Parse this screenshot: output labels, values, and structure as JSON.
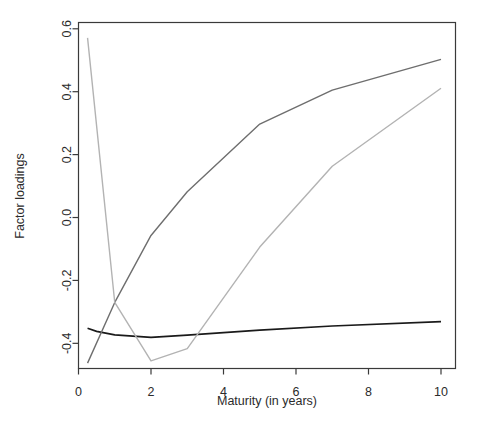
{
  "chart_data": {
    "type": "line",
    "title": "",
    "xlabel": "Maturity (in years)",
    "ylabel": "Factor loadings",
    "xlim": [
      0,
      10.4
    ],
    "ylim": [
      -0.48,
      0.62
    ],
    "xticks": [
      0,
      2,
      4,
      6,
      8,
      10
    ],
    "xticklabels": [
      "0",
      "2",
      "4",
      "6",
      "8",
      "10"
    ],
    "yticks": [
      -0.4,
      -0.2,
      0.0,
      0.2,
      0.4,
      0.6
    ],
    "yticklabels": [
      "-0.4",
      "-0.2",
      "0.0",
      "0.2",
      "0.4",
      "0.6"
    ],
    "grid": false,
    "legend": "none",
    "frame": true,
    "series": [
      {
        "name": "loading-1",
        "color": "#1a1a1a",
        "width": 1.6,
        "x": [
          0.25,
          0.5,
          1,
          2,
          3,
          5,
          7,
          10
        ],
        "y": [
          -0.352,
          -0.362,
          -0.373,
          -0.381,
          -0.374,
          -0.358,
          -0.345,
          -0.331
        ]
      },
      {
        "name": "loading-2",
        "color": "#6e6e6e",
        "width": 1.4,
        "x": [
          0.25,
          1,
          2,
          3,
          5,
          7,
          10
        ],
        "y": [
          -0.463,
          -0.27,
          -0.057,
          0.082,
          0.297,
          0.405,
          0.503
        ]
      },
      {
        "name": "loading-3",
        "color": "#b3b3b3",
        "width": 1.4,
        "x": [
          0.25,
          1,
          2,
          3,
          5,
          7,
          10
        ],
        "y": [
          0.571,
          -0.27,
          -0.456,
          -0.417,
          -0.094,
          0.163,
          0.411
        ]
      }
    ]
  },
  "axes": {
    "x_title": "Maturity (in years)",
    "y_title": "Factor loadings",
    "x_tick_labels": [
      "0",
      "2",
      "4",
      "6",
      "8",
      "10"
    ],
    "y_tick_labels": [
      "0.6",
      "0.4",
      "0.2",
      "0.0",
      "-0.2",
      "-0.4"
    ]
  },
  "colors": {
    "background": "#ffffff",
    "frame": "#3a3a3a",
    "text": "#2b2b2b",
    "series_1": "#1a1a1a",
    "series_2": "#6e6e6e",
    "series_3": "#b3b3b3"
  }
}
